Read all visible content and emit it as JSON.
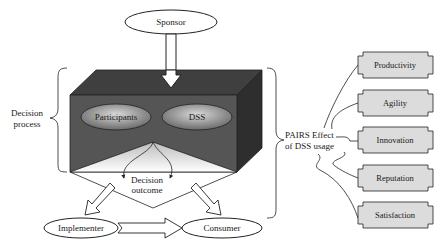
{
  "diagram": {
    "type": "flow-diagram",
    "top_node": {
      "label": "Sponsor",
      "shape": "ellipse"
    },
    "process": {
      "bracket_label_line1": "Decision",
      "bracket_label_line2": "process",
      "inner_nodes": [
        {
          "label": "Participants",
          "shape": "ellipse"
        },
        {
          "label": "DSS",
          "shape": "ellipse"
        }
      ],
      "outcome_line1": "Decision",
      "outcome_line2": "outcome"
    },
    "bottom_nodes": [
      {
        "label": "Implementer",
        "shape": "ellipse"
      },
      {
        "label": "Consumer",
        "shape": "ellipse"
      }
    ],
    "effect": {
      "label_line1": "PAIRS Effect",
      "label_line2": "of DSS  usage"
    },
    "outcomes": [
      {
        "label": "Productivity"
      },
      {
        "label": "Agility"
      },
      {
        "label": "Innovation"
      },
      {
        "label": "Reputation"
      },
      {
        "label": "Satisfaction"
      }
    ],
    "colors": {
      "cube_front": "#555555",
      "cube_top": "#3f3f3f",
      "cube_side": "#2e2e2e",
      "box_fill": "#dcdcdc",
      "line": "#222222"
    }
  }
}
